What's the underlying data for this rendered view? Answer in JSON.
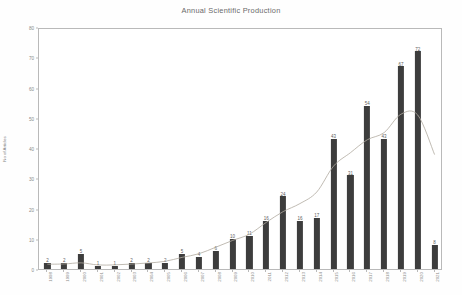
{
  "chart_data": {
    "type": "bar",
    "title": "Annual Scientific Production",
    "xlabel": "Year",
    "ylabel": "No of Articles",
    "categories": [
      "1998",
      "1999",
      "2000",
      "2001",
      "2002",
      "2003",
      "2004",
      "2005",
      "2006",
      "2007",
      "2008",
      "2009",
      "2010",
      "2011",
      "2012",
      "2013",
      "2014",
      "2015",
      "2016",
      "2017",
      "2018",
      "2019",
      "2020",
      "2021"
    ],
    "values": [
      2,
      2,
      5,
      1,
      1,
      2,
      2,
      2,
      5,
      4,
      6,
      10,
      11,
      16,
      24,
      16,
      17,
      43,
      31,
      54,
      43,
      67,
      72,
      8
    ],
    "ylim": [
      0,
      80
    ],
    "yticks": [
      0,
      10,
      20,
      30,
      40,
      50,
      60,
      70,
      80
    ],
    "grid": false,
    "legend": "none",
    "bar_color": "#3d3d3d",
    "trend_line_color": "#b0a9a0",
    "annotations": "Each bar is labelled with its value; a smooth grey trend curve overlays the bars."
  },
  "colors": {
    "background": "#ffffff",
    "axis": "#b9b9b9",
    "title_text": "#6a6a6a",
    "tick_text": "#8a8a8a",
    "label_text": "#5d5d5d"
  }
}
